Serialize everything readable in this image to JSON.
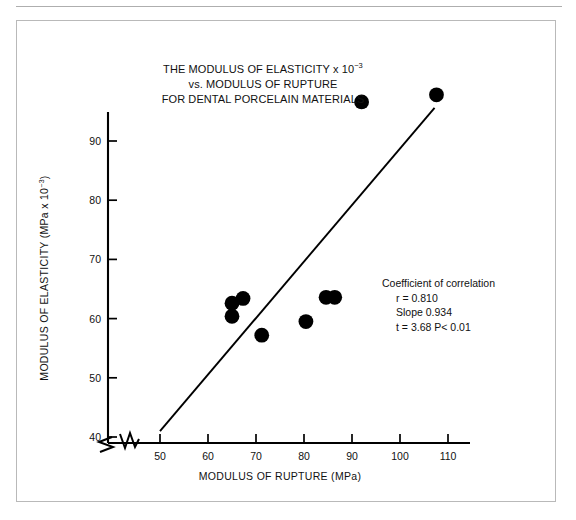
{
  "figure": {
    "title_lines": [
      "THE MODULUS OF ELASTICITY x 10",
      "vs. MODULUS OF RUPTURE",
      "FOR DENTAL PORCELAIN MATERIALS"
    ],
    "title_exponent": "−3",
    "x_axis_title": "MODULUS OF RUPTURE (MPa)",
    "y_axis_title_main": "MODULUS OF ELASTICITY (MPa x 10",
    "y_axis_title_exponent": "−3",
    "y_axis_title_tail": ")",
    "stats": {
      "heading": "Coefficient of correlation",
      "r_line": "r = 0.810",
      "slope_line": "Slope 0.934",
      "t_line": "t = 3.68 P< 0.01"
    }
  },
  "chart_data": {
    "type": "scatter",
    "xlabel": "MODULUS OF RUPTURE (MPa)",
    "ylabel": "MODULUS OF ELASTICITY (MPa x 10⁻³)",
    "xlim": [
      46,
      118
    ],
    "ylim": [
      38.5,
      101
    ],
    "xticks": [
      50,
      60,
      70,
      80,
      90,
      100,
      110
    ],
    "yticks": [
      40,
      50,
      60,
      70,
      80,
      90
    ],
    "xtick_labels": [
      "50",
      "60",
      "70",
      "80",
      "90",
      "100",
      "110"
    ],
    "ytick_labels": [
      "40",
      "50",
      "60",
      "70",
      "80",
      "90"
    ],
    "grid": false,
    "legend": false,
    "axis_break_x": true,
    "axis_break_y": true,
    "points": [
      {
        "x": 65.0,
        "y": 62.6
      },
      {
        "x": 65.0,
        "y": 60.4
      },
      {
        "x": 67.3,
        "y": 63.4
      },
      {
        "x": 71.2,
        "y": 57.2
      },
      {
        "x": 80.4,
        "y": 59.5
      },
      {
        "x": 84.6,
        "y": 63.6
      },
      {
        "x": 86.4,
        "y": 63.6
      },
      {
        "x": 92.0,
        "y": 96.6
      },
      {
        "x": 107.6,
        "y": 97.8
      }
    ],
    "fit_line": {
      "x_start": 50.0,
      "y_start": 41.0,
      "x_end": 107.2,
      "y_end": 95.6,
      "slope": 0.934,
      "r": 0.81,
      "t": 3.68,
      "p_text": "P< 0.01"
    }
  }
}
